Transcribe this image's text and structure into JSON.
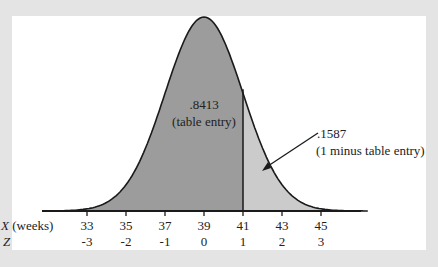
{
  "chart_data": {
    "type": "area",
    "title": "",
    "distribution": "normal",
    "mean": 39,
    "sd": 2,
    "x_axis_label": "X (weeks)",
    "z_axis_label": "Z",
    "x_ticks": [
      33,
      35,
      37,
      39,
      41,
      43,
      45
    ],
    "z_ticks": [
      "-3",
      "-2",
      "-1",
      "0",
      "1",
      "2",
      "3"
    ],
    "cutoff_x": 41,
    "regions": [
      {
        "name": "left",
        "value_label": ".8413",
        "note": "(table entry)",
        "color": "#9c9c9c"
      },
      {
        "name": "right",
        "value_label": ".1587",
        "note": "(1 minus table entry)",
        "color": "#cbcbcb"
      }
    ]
  },
  "colors": {
    "outer_bg": "#e4e4e4",
    "panel": "#ffffff",
    "line": "#1a1a1a"
  }
}
